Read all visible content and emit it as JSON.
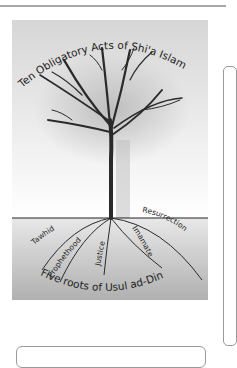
{
  "diagram": {
    "title": "Ten Obligatory Acts of Shi'a Islam",
    "footer": "Five roots of Usul ad-Din",
    "roots": [
      "Tawhid",
      "Prophethood",
      "Justice",
      "Imamate",
      "Resurrection"
    ]
  },
  "colors": {
    "sky_top": "#d8d8d8",
    "sky_bottom": "#ffffff",
    "ground_top": "#e6e6e6",
    "ground_bottom": "#b4b4b4",
    "tree": "#2a2a2a",
    "rule": "#a8a8a8"
  }
}
